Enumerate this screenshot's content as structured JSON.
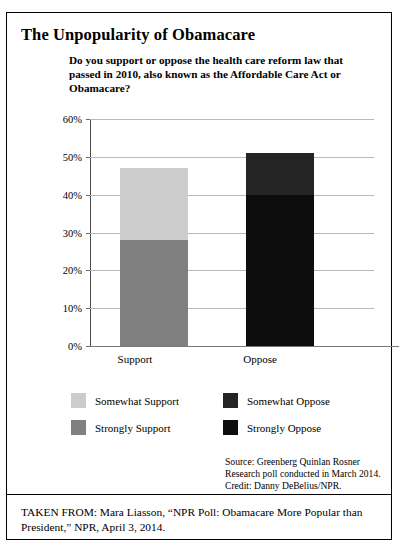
{
  "figure": {
    "title": "The Unpopularity of Obamacare",
    "question": "Do you support or oppose the health care reform law that passed in 2010, also known as the Affordable Care Act or Obamacare?",
    "source": "Source: Greenberg Quinlan Rosner Research poll conducted in March 2014. Credit: Danny DeBelius/NPR.",
    "caption": "TAKEN FROM: Mara Liasson, “NPR Poll: Obamacare More Popular than President,” NPR, April 3, 2014."
  },
  "chart_data": {
    "type": "bar",
    "stacked": true,
    "title": "Do you support or oppose the health care reform law that passed in 2010, also known as the Affordable Care Act or Obamacare?",
    "xlabel": "",
    "ylabel": "",
    "categories": [
      "Support",
      "Oppose"
    ],
    "ylim": [
      0,
      60
    ],
    "ytick_labels": [
      "0%",
      "10%",
      "20%",
      "30%",
      "40%",
      "50%",
      "60%"
    ],
    "ytick_values": [
      0,
      10,
      20,
      30,
      40,
      50,
      60
    ],
    "grid": true,
    "legend_position": "below",
    "series": [
      {
        "name": "Strongly Support",
        "color": "#808080",
        "values": [
          28,
          0
        ]
      },
      {
        "name": "Somewhat Support",
        "color": "#cccccc",
        "values": [
          19,
          0
        ]
      },
      {
        "name": "Strongly Oppose",
        "color": "#0d0d0d",
        "values": [
          0,
          40
        ]
      },
      {
        "name": "Somewhat Oppose",
        "color": "#242424",
        "values": [
          0,
          11
        ]
      }
    ],
    "totals": [
      47,
      51
    ],
    "annotations": []
  },
  "legend": {
    "items": [
      {
        "label": "Somewhat Support",
        "color": "#cccccc"
      },
      {
        "label": "Somewhat Oppose",
        "color": "#242424"
      },
      {
        "label": "Strongly Support",
        "color": "#808080"
      },
      {
        "label": "Strongly Oppose",
        "color": "#0d0d0d"
      }
    ]
  }
}
